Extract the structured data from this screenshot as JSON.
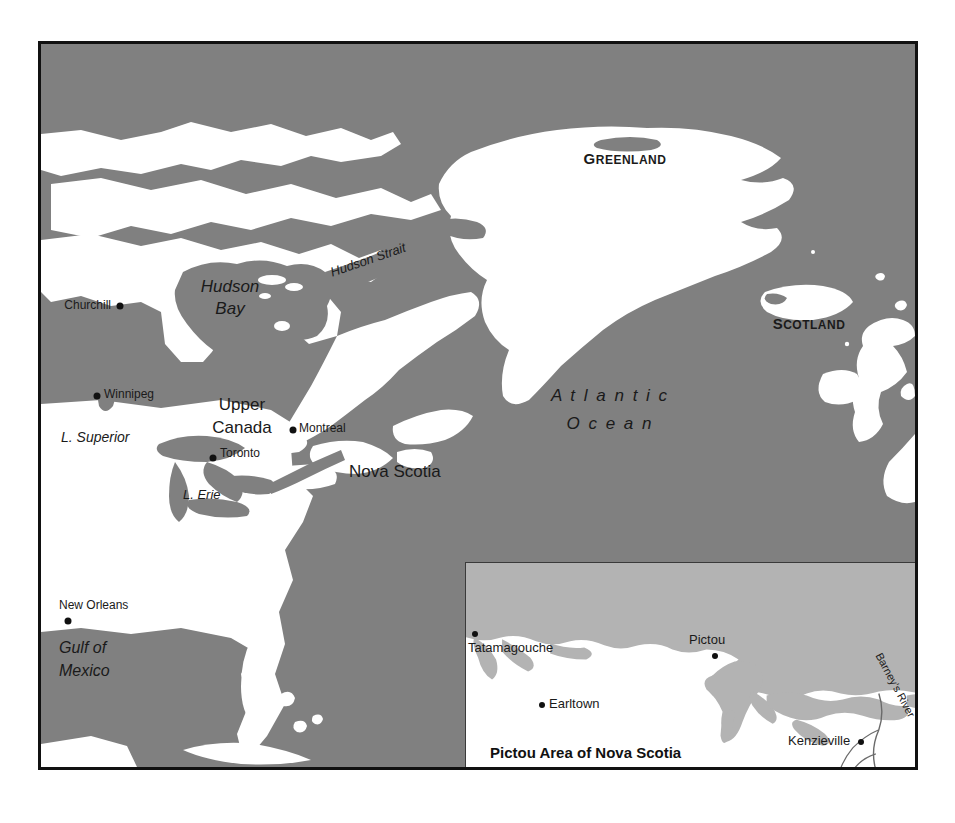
{
  "figure": {
    "kind": "historical-reference-map",
    "colors": {
      "ocean_gray": "#808080",
      "land_white": "#ffffff",
      "inset_water_gray": "#b3b3b3",
      "frame_black": "#111111",
      "inset_frame": "#3a3a3a",
      "label_ink": "#1a1a1a"
    }
  },
  "main_map": {
    "region_labels": [
      {
        "key": "greenland",
        "text": "GREENLAND",
        "style": "small-caps-bold",
        "first": "G",
        "rest": "REENLAND"
      },
      {
        "key": "scotland",
        "text": "SCOTLAND",
        "style": "small-caps-bold",
        "first": "S",
        "rest": "COTLAND"
      },
      {
        "key": "upper_canada_line1",
        "text": "Upper"
      },
      {
        "key": "upper_canada_line2",
        "text": "Canada"
      },
      {
        "key": "nova_scotia",
        "text": "Nova Scotia"
      }
    ],
    "water_labels": [
      {
        "key": "atlantic_line1",
        "text": "A t l a n t i c"
      },
      {
        "key": "atlantic_line2",
        "text": "O c e a n"
      },
      {
        "key": "hudson_bay_line1",
        "text": "Hudson"
      },
      {
        "key": "hudson_bay_line2",
        "text": "Bay"
      },
      {
        "key": "hudson_strait",
        "text": "Hudson Strait"
      },
      {
        "key": "l_superior",
        "text": "L. Superior"
      },
      {
        "key": "l_erie",
        "text": "L. Erie"
      },
      {
        "key": "gulf_line1",
        "text": "Gulf of"
      },
      {
        "key": "gulf_line2",
        "text": "Mexico"
      }
    ],
    "cities": [
      {
        "key": "churchill",
        "text": "Churchill",
        "dot_side": "right"
      },
      {
        "key": "winnipeg",
        "text": "Winnipeg",
        "dot_side": "left"
      },
      {
        "key": "montreal",
        "text": "Montreal",
        "dot_side": "left"
      },
      {
        "key": "toronto",
        "text": "Toronto",
        "dot_side": "left"
      },
      {
        "key": "new_orleans",
        "text": "New Orleans",
        "dot_side": "below"
      }
    ]
  },
  "inset": {
    "title": "Pictou Area of Nova Scotia",
    "places": [
      {
        "key": "tatamagouche",
        "text": "Tatamagouche"
      },
      {
        "key": "pictou",
        "text": "Pictou"
      },
      {
        "key": "earltown",
        "text": "Earltown"
      },
      {
        "key": "kenzieville",
        "text": "Kenzieville"
      }
    ],
    "features": [
      {
        "key": "barneys_river",
        "text": "Barney's River"
      }
    ]
  }
}
